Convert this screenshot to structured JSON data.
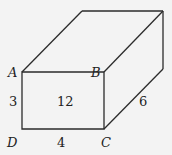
{
  "figure": {
    "type": "rectangular prism",
    "vertices": [
      {
        "name": "A",
        "label": "A"
      },
      {
        "name": "B",
        "label": "B"
      },
      {
        "name": "C",
        "label": "C"
      },
      {
        "name": "D",
        "label": "D"
      }
    ],
    "measurements": {
      "AD": "3",
      "DC": "4",
      "depth": "6",
      "front_face_area": "12"
    }
  }
}
